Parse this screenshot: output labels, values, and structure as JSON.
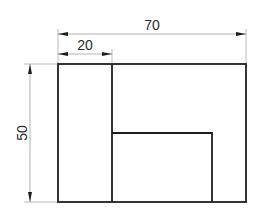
{
  "drawing": {
    "type": "technical-drawing-front-view",
    "units": "mm",
    "colors": {
      "line": "#1e1e1e",
      "dimension": "#9a9a9a",
      "text": "#2a2a2a",
      "background": "#ffffff"
    },
    "dimensions": {
      "overall_width": {
        "label": "70",
        "value": 70
      },
      "left_part_width": {
        "label": "20",
        "value": 20
      },
      "overall_height": {
        "label": "50",
        "value": 50
      }
    },
    "shapes": {
      "outer_rectangle": "70 x 50",
      "left_strip": "20 x 50",
      "inner_rectangle": "lower-middle block"
    }
  }
}
